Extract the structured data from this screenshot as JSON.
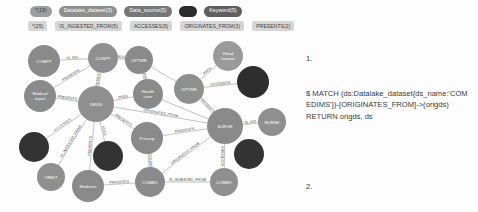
{
  "legend": {
    "node_types": [
      {
        "label": "*(19)",
        "color": "#9e9e9e"
      },
      {
        "label": "Datalake_dataset(3)",
        "color": "#8f8f8f"
      },
      {
        "label": "Data_source(5)",
        "color": "#777777"
      },
      {
        "label": "*(2)",
        "color": "#2b2b2b"
      },
      {
        "label": "Keyword(5)",
        "color": "#5f5f5f"
      }
    ],
    "relationship_types": [
      {
        "label": "*(25)"
      },
      {
        "label": "IS_INGESTED_FROM(5)"
      },
      {
        "label": "ACCESSES(5)"
      },
      {
        "label": "ORIGINATES_FROM(3)"
      },
      {
        "label": "PRESENTS(2)"
      }
    ]
  },
  "graph": {
    "nodes": [
      {
        "id": "n1",
        "label": "COMPT",
        "x": 44,
        "y": 27,
        "r": 16,
        "color": "#8a8a8a"
      },
      {
        "id": "n2",
        "label": "CLINPT",
        "x": 103,
        "y": 24,
        "r": 15,
        "color": "#8f8f8f"
      },
      {
        "id": "n3",
        "label": "OPTWR",
        "x": 139,
        "y": 26,
        "r": 14,
        "color": "#8a8a8a"
      },
      {
        "id": "n4",
        "label": "Head trauma",
        "x": 228,
        "y": 22,
        "r": 15,
        "color": "#9a9a9a"
      },
      {
        "id": "n5",
        "label": "",
        "x": 253,
        "y": 48,
        "r": 16,
        "color": "#2e2e2e"
      },
      {
        "id": "n6",
        "label": "OPTWR",
        "x": 189,
        "y": 55,
        "r": 15,
        "color": "#8f8f8f"
      },
      {
        "id": "n7",
        "label": "Health care",
        "x": 148,
        "y": 60,
        "r": 15,
        "color": "#8a8a8a"
      },
      {
        "id": "n8",
        "label": "Medical report",
        "x": 40,
        "y": 62,
        "r": 16,
        "color": "#8a8a8a"
      },
      {
        "id": "n9",
        "label": "DRUG",
        "x": 96,
        "y": 70,
        "r": 18,
        "color": "#8f8f8f"
      },
      {
        "id": "n10",
        "label": "SURGE",
        "x": 225,
        "y": 92,
        "r": 18,
        "color": "#8a8a8a"
      },
      {
        "id": "n11",
        "label": "NURSE",
        "x": 272,
        "y": 88,
        "r": 14,
        "color": "#8f8f8f"
      },
      {
        "id": "n12",
        "label": "Prescrp",
        "x": 147,
        "y": 104,
        "r": 16,
        "color": "#8a8a8a"
      },
      {
        "id": "n13",
        "label": "",
        "x": 34,
        "y": 113,
        "r": 15,
        "color": "#333333"
      },
      {
        "id": "n14",
        "label": "",
        "x": 108,
        "y": 122,
        "r": 15,
        "color": "#333333"
      },
      {
        "id": "n15",
        "label": "",
        "x": 249,
        "y": 120,
        "r": 15,
        "color": "#333333"
      },
      {
        "id": "n16",
        "label": "ORBIT",
        "x": 51,
        "y": 143,
        "r": 14,
        "color": "#8f8f8f"
      },
      {
        "id": "n17",
        "label": "Medicine",
        "x": 88,
        "y": 152,
        "r": 16,
        "color": "#8a8a8a"
      },
      {
        "id": "n18",
        "label": "COMED",
        "x": 150,
        "y": 148,
        "r": 15,
        "color": "#8a8a8a"
      },
      {
        "id": "n19",
        "label": "COMED",
        "x": 224,
        "y": 148,
        "r": 14,
        "color": "#8f8f8f"
      }
    ],
    "edges": [
      {
        "from": "n1",
        "to": "n2",
        "label": "IS_ING..."
      },
      {
        "from": "n2",
        "to": "n9",
        "label": "PRESENTS"
      },
      {
        "from": "n2",
        "to": "n3",
        "label": "PRESEN"
      },
      {
        "from": "n3",
        "to": "n7",
        "label": "IS_INGES"
      },
      {
        "from": "n3",
        "to": "n6",
        "label": ""
      },
      {
        "from": "n4",
        "to": "n6",
        "label": "PRES"
      },
      {
        "from": "n6",
        "to": "n5",
        "label": "ACCESSES"
      },
      {
        "from": "n6",
        "to": "n10",
        "label": "PRESENTS"
      },
      {
        "from": "n7",
        "to": "n9",
        "label": "PRES"
      },
      {
        "from": "n7",
        "to": "n10",
        "label": ""
      },
      {
        "from": "n8",
        "to": "n2",
        "label": "PRESENTS"
      },
      {
        "from": "n8",
        "to": "n9",
        "label": "PRESENTS"
      },
      {
        "from": "n9",
        "to": "n10",
        "label": "ORIGINATES_FROM"
      },
      {
        "from": "n9",
        "to": "n12",
        "label": "PRESENTS"
      },
      {
        "from": "n9",
        "to": "n13",
        "label": "ACCESSES"
      },
      {
        "from": "n9",
        "to": "n16",
        "label": "IS_INGESTED_FROM"
      },
      {
        "from": "n9",
        "to": "n17",
        "label": "PRESENTS"
      },
      {
        "from": "n9",
        "to": "n14",
        "label": "ACCE"
      },
      {
        "from": "n10",
        "to": "n11",
        "label": "IS_ING"
      },
      {
        "from": "n10",
        "to": "n12",
        "label": "PRESENTS"
      },
      {
        "from": "n10",
        "to": "n18",
        "label": "ORIGINATES_FROM"
      },
      {
        "from": "n10",
        "to": "n19",
        "label": "ACCESSES"
      },
      {
        "from": "n12",
        "to": "n18",
        "label": "ACCESSES"
      },
      {
        "from": "n17",
        "to": "n18",
        "label": "PRESENTS"
      },
      {
        "from": "n18",
        "to": "n19",
        "label": "IS_INGESTED_FROM"
      }
    ]
  },
  "queries": [
    {
      "index": "1.",
      "text": "$ MATCH (ds:Datalake_dataset{ds_name:'COM EDIMS'})-[ORIGINATES_FROM]->(origds) RETURN origds, ds"
    },
    {
      "index": "2.",
      "text": "$ MATCH (ds:Datalake_dataset{ds_name:'COM EDIMS'})-[ORIGINATES_FROM]->(origds)-[r]-(b) RETURN origds, ds, r,b"
    }
  ]
}
